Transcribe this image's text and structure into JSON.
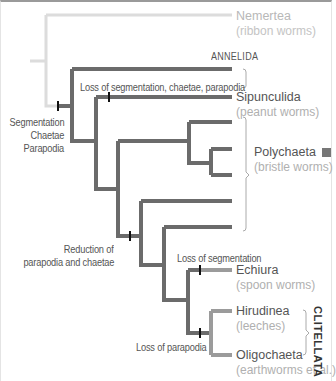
{
  "colors": {
    "outgroup": "#dcdcdc",
    "main_branch": "#6b6b6b",
    "minor_branch": "#9b9b9b",
    "bracket": "#aaaaaa",
    "polychaeta_marker": "#777777"
  },
  "clades": {
    "annelida": "ANNELIDA",
    "clitellata": "CLITELLATA"
  },
  "taxa": [
    {
      "name": "Nemertea",
      "common": "(ribbon worms)"
    },
    {
      "name": "Sipunculida",
      "common": "(peanut worms)"
    },
    {
      "name": "Polychaeta",
      "common": "(bristle worms)"
    },
    {
      "name": "Echiura",
      "common": "(spoon worms)"
    },
    {
      "name": "Hirudinea",
      "common": "(leeches)"
    },
    {
      "name": "Oligochaeta",
      "common": "(earthworms et al.)"
    }
  ],
  "events": {
    "root_line1": "Segmentation",
    "root_line2": "Chaetae",
    "root_line3": "Parapodia",
    "sipuncula_loss": "Loss of segmentation, chaetae, parapodia",
    "reduction_line1": "Reduction of",
    "reduction_line2": "parapodia and chaetae",
    "echiura_loss": "Loss of segmentation",
    "clitellata_loss": "Loss of parapodia"
  }
}
